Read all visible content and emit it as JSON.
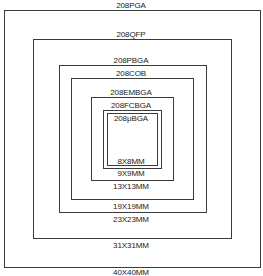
{
  "diagram": {
    "type": "nested-package-size-comparison",
    "packages": [
      {
        "name": "208PGA",
        "size": "40X40MM"
      },
      {
        "name": "208QFP",
        "size": "31X31MM"
      },
      {
        "name": "208PBGA",
        "size": "23X23MM"
      },
      {
        "name": "208COB",
        "size": "19X19MM"
      },
      {
        "name": "208EMBGA",
        "size": "13X13MM"
      },
      {
        "name": "208FCBGA",
        "size": "9X9MM"
      },
      {
        "name": "208μBGA",
        "size": "8X8MM"
      }
    ],
    "colors": {
      "line": "#3a3a3a",
      "text": "#222222",
      "background": "#ffffff"
    }
  }
}
